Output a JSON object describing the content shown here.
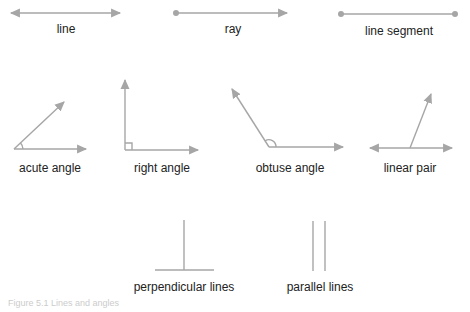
{
  "labels": {
    "line": "line",
    "ray": "ray",
    "line_segment": "line segment",
    "acute_angle": "acute angle",
    "right_angle": "right angle",
    "obtuse_angle": "obtuse angle",
    "linear_pair": "linear pair",
    "perpendicular_lines": "perpendicular lines",
    "parallel_lines": "parallel lines"
  },
  "caption": "Figure 5.1 Lines and angles",
  "colors": {
    "stroke": "#a6a6a6",
    "text": "#222222"
  }
}
